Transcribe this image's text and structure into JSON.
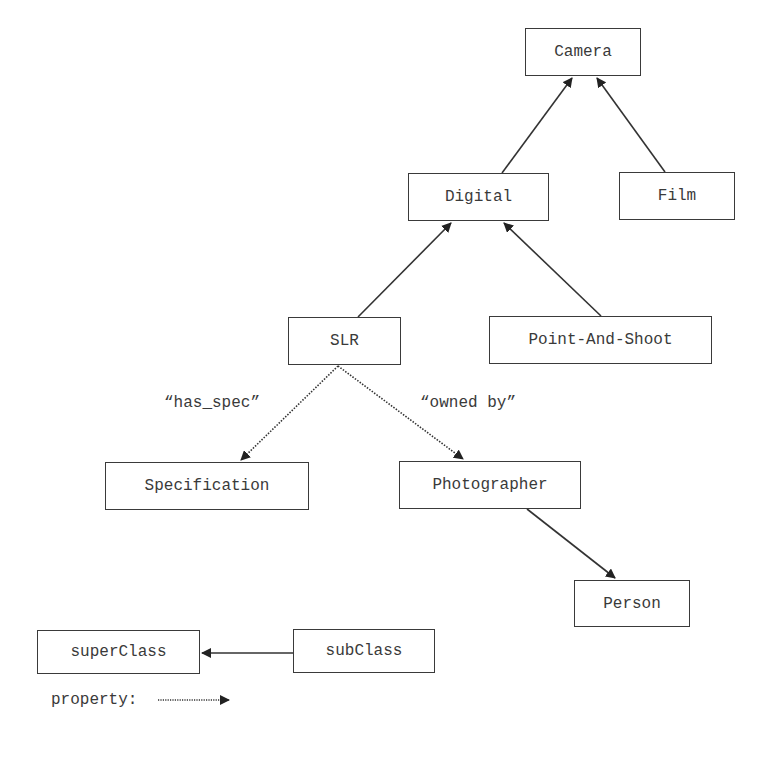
{
  "diagram": {
    "nodes": {
      "camera": "Camera",
      "digital": "Digital",
      "film": "Film",
      "slr": "SLR",
      "point_and_shoot": "Point-And-Shoot",
      "specification": "Specification",
      "photographer": "Photographer",
      "person": "Person"
    },
    "edges": [
      {
        "from": "Digital",
        "to": "Camera",
        "type": "subclass"
      },
      {
        "from": "Film",
        "to": "Camera",
        "type": "subclass"
      },
      {
        "from": "SLR",
        "to": "Digital",
        "type": "subclass"
      },
      {
        "from": "Point-And-Shoot",
        "to": "Digital",
        "type": "subclass"
      },
      {
        "from": "SLR",
        "to": "Specification",
        "type": "property",
        "label": "“has_spec”"
      },
      {
        "from": "SLR",
        "to": "Photographer",
        "type": "property",
        "label": "“owned by”"
      },
      {
        "from": "Photographer",
        "to": "Person",
        "type": "subclass"
      }
    ],
    "edge_labels": {
      "has_spec": "“has_spec”",
      "owned_by": "“owned by”"
    },
    "legend": {
      "superclass": "superClass",
      "subclass": "subClass",
      "property_label": "property:"
    },
    "colors": {
      "stroke": "#3a3a3a",
      "background": "#ffffff"
    }
  }
}
